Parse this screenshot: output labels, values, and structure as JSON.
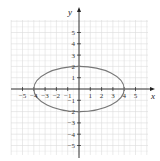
{
  "chart_data": {
    "type": "line",
    "title": "",
    "xlabel": "x",
    "ylabel": "y",
    "xlim": [
      -5.5,
      5.5
    ],
    "ylim": [
      -6,
      6
    ],
    "grid": true,
    "x_ticks": [
      -5,
      -4,
      -3,
      -2,
      -1,
      1,
      2,
      3,
      4,
      5
    ],
    "y_ticks": [
      -5,
      -4,
      -3,
      -2,
      -1,
      1,
      2,
      3,
      4,
      5
    ],
    "x_tick_labels": [
      "−5",
      "−4",
      "−3",
      "−2",
      "−1",
      "1",
      "2",
      "3",
      "4",
      "5"
    ],
    "y_tick_labels": [
      "−5",
      "−4",
      "−3",
      "−2",
      "−1",
      "1",
      "2",
      "3",
      "4",
      "5"
    ],
    "series": [
      {
        "name": "ellipse",
        "equation": "x^2/16 + y^2/4 = 1",
        "center": [
          0,
          0
        ],
        "semi_major_x": 4,
        "semi_minor_y": 2,
        "vertices": [
          [
            -4,
            0
          ],
          [
            4,
            0
          ],
          [
            0,
            2
          ],
          [
            0,
            -2
          ]
        ],
        "color": "#777777"
      }
    ]
  },
  "colors": {
    "grid": "#dcdcdc",
    "axis": "#222222",
    "curve": "#777777"
  }
}
